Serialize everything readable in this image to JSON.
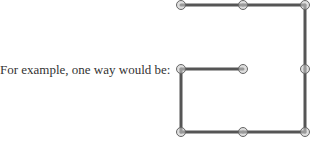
{
  "caption": "For example, one way would be:",
  "grid": {
    "cols": 3,
    "rows": 3
  },
  "path": [
    [
      1,
      1
    ],
    [
      0,
      1
    ],
    [
      0,
      2
    ],
    [
      1,
      2
    ],
    [
      2,
      2
    ],
    [
      2,
      1
    ],
    [
      2,
      0
    ],
    [
      1,
      0
    ],
    [
      0,
      0
    ]
  ],
  "colors": {
    "line": "#555555",
    "node_fill": "#c8c8c8",
    "node_stroke": "#666666"
  }
}
